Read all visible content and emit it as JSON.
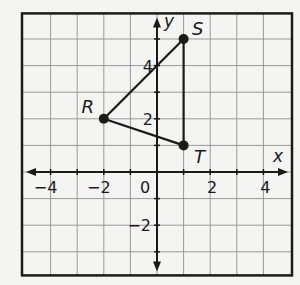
{
  "figure": {
    "type": "coordinate-plane-triangle",
    "background": "#f4f4f3",
    "grid_color": "#9a9a9a",
    "ink_color": "#1a1a1a",
    "x_range": [
      -5,
      5
    ],
    "y_range": [
      -4,
      6
    ],
    "axes": {
      "x_label": "x",
      "y_label": "y",
      "origin_label": "0",
      "x_ticks": [
        {
          "value": -4,
          "label": "−4"
        },
        {
          "value": -2,
          "label": "−2"
        },
        {
          "value": 2,
          "label": "2"
        },
        {
          "value": 4,
          "label": "4"
        }
      ],
      "y_ticks": [
        {
          "value": 4,
          "label": "4"
        },
        {
          "value": 2,
          "label": "2"
        },
        {
          "value": -2,
          "label": "−2"
        }
      ]
    },
    "points": [
      {
        "name": "R",
        "x": -2,
        "y": 2
      },
      {
        "name": "S",
        "x": 1,
        "y": 5
      },
      {
        "name": "T",
        "x": 1,
        "y": 1
      }
    ],
    "polygon": [
      "R",
      "S",
      "T"
    ]
  }
}
